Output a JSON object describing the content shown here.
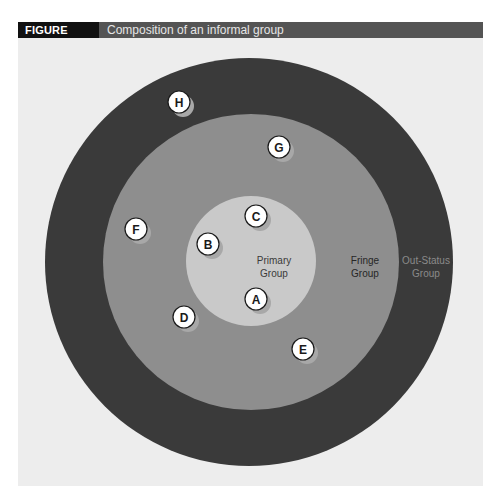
{
  "figure": {
    "number_label": "FIGURE 7.17",
    "title": "Composition of an informal group"
  },
  "rings": [
    {
      "id": "out-status",
      "label_line1": "Out-Status",
      "label_line2": "Group",
      "color": "#3a3a3a",
      "label_color": "#8a8a8a"
    },
    {
      "id": "fringe",
      "label_line1": "Fringe",
      "label_line2": "Group",
      "color": "#8c8c8c",
      "label_color": "#2a2a2a"
    },
    {
      "id": "primary",
      "label_line1": "Primary",
      "label_line2": "Group",
      "color": "#c8c8c8",
      "label_color": "#3a3a3a"
    }
  ],
  "members": [
    {
      "letter": "A",
      "group": "primary"
    },
    {
      "letter": "B",
      "group": "primary"
    },
    {
      "letter": "C",
      "group": "primary"
    },
    {
      "letter": "D",
      "group": "fringe"
    },
    {
      "letter": "E",
      "group": "fringe"
    },
    {
      "letter": "F",
      "group": "fringe"
    },
    {
      "letter": "G",
      "group": "fringe"
    },
    {
      "letter": "H",
      "group": "out-status"
    }
  ]
}
